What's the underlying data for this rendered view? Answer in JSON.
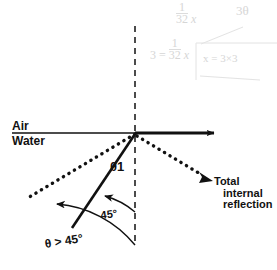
{
  "figure": {
    "labels": {
      "air": "Air",
      "water": "Water",
      "theta1": "θ1",
      "angle_45": "45°",
      "theta_gt_45": "θ > 45°",
      "tir_line1": "Total",
      "tir_line2": "internal",
      "tir_line3": "reflection"
    },
    "colors": {
      "ink": "#111111",
      "ghost": "#cfcfcf",
      "background": "#ffffff"
    },
    "geometry": {
      "interface_y": 133,
      "origin_x": 135,
      "origin_y": 133,
      "normal_line": "vertical dashed",
      "horizontal_line": "solid with right arrow"
    }
  },
  "ghost_notes": {
    "note1": "1",
    "note1b": "32",
    "note1c": "x",
    "note2": "3θ",
    "note3": "3 =",
    "note3b": "1",
    "note3c": "32",
    "note3d": "x",
    "note4": "x = 3×3"
  }
}
